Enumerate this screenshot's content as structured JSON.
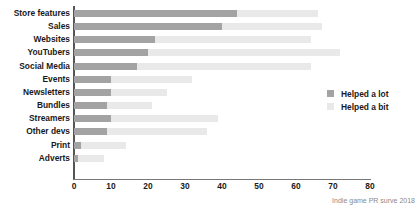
{
  "chart_data": {
    "type": "bar",
    "orientation": "horizontal",
    "stacked": true,
    "title": "",
    "subtitle": "",
    "xlabel": "",
    "ylabel": "",
    "xlim": [
      0,
      80
    ],
    "ylim": null,
    "grid": false,
    "legend_position": "right",
    "categories": [
      "Store features",
      "Sales",
      "Websites",
      "YouTubers",
      "Social Media",
      "Events",
      "Newsletters",
      "Bundles",
      "Streamers",
      "Other devs",
      "Print",
      "Adverts"
    ],
    "series": [
      {
        "name": "Helped a lot",
        "color": "#a3a3a3",
        "values": [
          44,
          40,
          22,
          20,
          17,
          10,
          10,
          9,
          10,
          9,
          2,
          1
        ]
      },
      {
        "name": "Helped a bit",
        "color": "#e9e9e9",
        "values": [
          22,
          27,
          42,
          52,
          47,
          22,
          15,
          12,
          29,
          27,
          12,
          7
        ]
      }
    ],
    "totals": [
      66,
      67,
      64,
      72,
      64,
      32,
      25,
      21,
      39,
      36,
      14,
      8
    ],
    "xticks": [
      0,
      10,
      20,
      30,
      40,
      50,
      60,
      70,
      80
    ],
    "xtick_labels": [
      "0",
      "10",
      "20",
      "30",
      "40",
      "50",
      "60",
      "70",
      "80"
    ],
    "annotations": [
      "Indie game PR surve 2018"
    ]
  },
  "legend": {
    "items": [
      {
        "label": "Helped a lot",
        "color": "#a3a3a3"
      },
      {
        "label": "Helped a bit",
        "color": "#e9e9e9"
      }
    ]
  },
  "caption": {
    "text": "Indie game PR surve 2018"
  },
  "colors": {
    "helped_a_lot": "#a3a3a3",
    "helped_a_bit": "#e9e9e9",
    "axis": "#555555",
    "text": "#1a1a1a",
    "caption": "#8a8a8a",
    "background": "#ffffff"
  }
}
